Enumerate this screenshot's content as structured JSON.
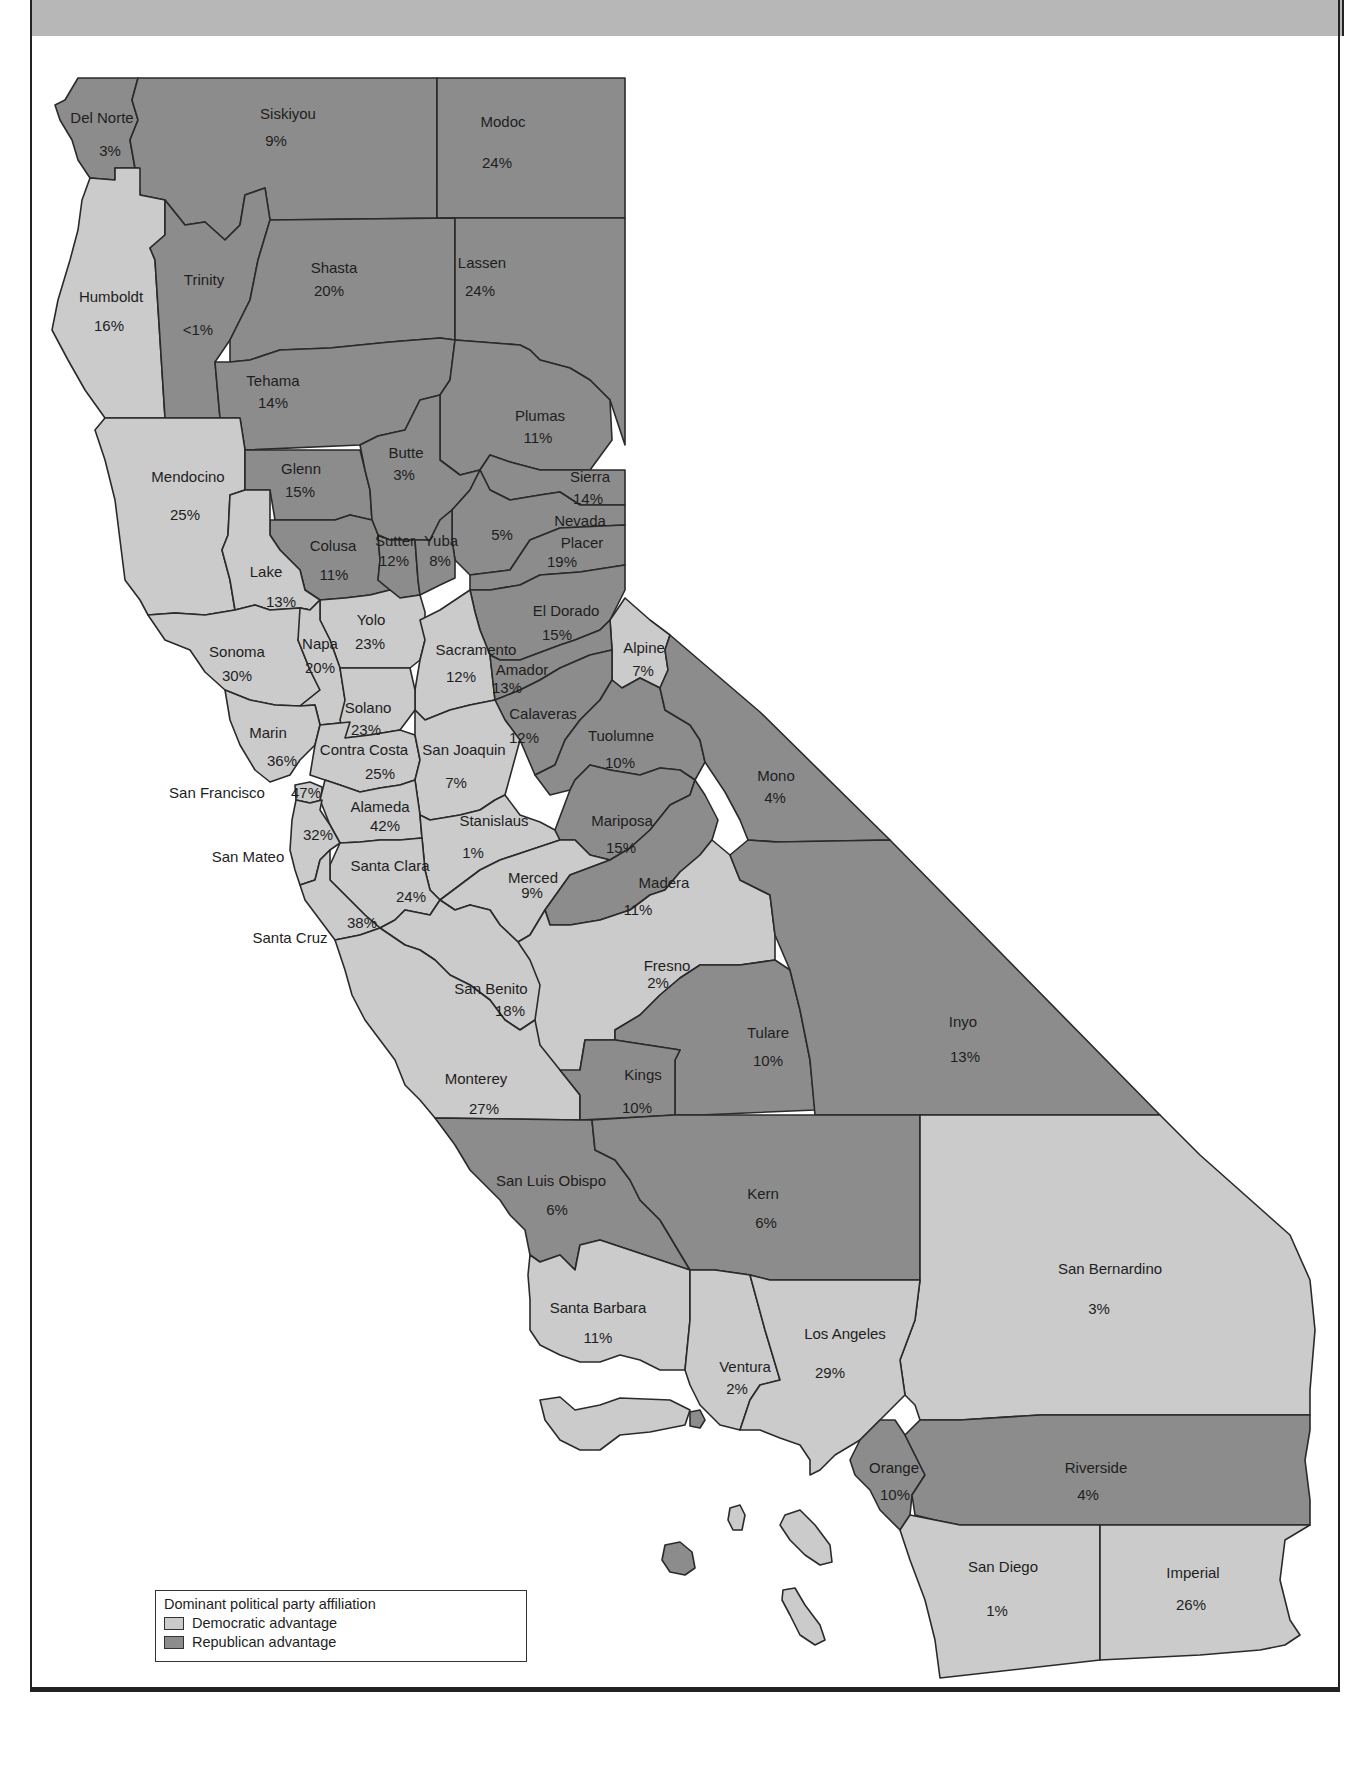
{
  "legend": {
    "title": "Dominant political party affiliation",
    "items": [
      {
        "label": "Democratic advantage",
        "color": "#cbcbcb"
      },
      {
        "label": "Republican advantage",
        "color": "#8c8c8c"
      }
    ]
  },
  "colors": {
    "democratic": "#cbcbcb",
    "republican": "#8c8c8c",
    "header_band": "#b7b7b7"
  },
  "counties": [
    {
      "name": "Del Norte",
      "value": "3%",
      "party": "Republican"
    },
    {
      "name": "Siskiyou",
      "value": "9%",
      "party": "Republican"
    },
    {
      "name": "Modoc",
      "value": "24%",
      "party": "Republican"
    },
    {
      "name": "Humboldt",
      "value": "16%",
      "party": "Democratic"
    },
    {
      "name": "Trinity",
      "value": "<1%",
      "party": "Republican"
    },
    {
      "name": "Shasta",
      "value": "20%",
      "party": "Republican"
    },
    {
      "name": "Lassen",
      "value": "24%",
      "party": "Republican"
    },
    {
      "name": "Tehama",
      "value": "14%",
      "party": "Republican"
    },
    {
      "name": "Plumas",
      "value": "11%",
      "party": "Republican"
    },
    {
      "name": "Mendocino",
      "value": "25%",
      "party": "Democratic"
    },
    {
      "name": "Glenn",
      "value": "15%",
      "party": "Republican"
    },
    {
      "name": "Butte",
      "value": "3%",
      "party": "Republican"
    },
    {
      "name": "Sierra",
      "value": "14%",
      "party": "Republican"
    },
    {
      "name": "Nevada",
      "value": "5%",
      "party": "Republican"
    },
    {
      "name": "Placer",
      "value": "19%",
      "party": "Republican"
    },
    {
      "name": "Colusa",
      "value": "11%",
      "party": "Republican"
    },
    {
      "name": "Sutter",
      "value": "12%",
      "party": "Republican"
    },
    {
      "name": "Yuba",
      "value": "8%",
      "party": "Republican"
    },
    {
      "name": "Lake",
      "value": "13%",
      "party": "Democratic"
    },
    {
      "name": "El Dorado",
      "value": "15%",
      "party": "Republican"
    },
    {
      "name": "Yolo",
      "value": "23%",
      "party": "Democratic"
    },
    {
      "name": "Sonoma",
      "value": "30%",
      "party": "Democratic"
    },
    {
      "name": "Napa",
      "value": "20%",
      "party": "Democratic"
    },
    {
      "name": "Sacramento",
      "value": "12%",
      "party": "Democratic"
    },
    {
      "name": "Alpine",
      "value": "7%",
      "party": "Democratic"
    },
    {
      "name": "Amador",
      "value": "13%",
      "party": "Republican"
    },
    {
      "name": "Solano",
      "value": "23%",
      "party": "Democratic"
    },
    {
      "name": "Calaveras",
      "value": "12%",
      "party": "Republican"
    },
    {
      "name": "Marin",
      "value": "36%",
      "party": "Democratic"
    },
    {
      "name": "Contra Costa",
      "value": "25%",
      "party": "Democratic"
    },
    {
      "name": "San Joaquin",
      "value": "7%",
      "party": "Democratic"
    },
    {
      "name": "Tuolumne",
      "value": "10%",
      "party": "Republican"
    },
    {
      "name": "Mono",
      "value": "4%",
      "party": "Republican"
    },
    {
      "name": "San Francisco",
      "value": "47%",
      "party": "Democratic"
    },
    {
      "name": "Alameda",
      "value": "42%",
      "party": "Democratic"
    },
    {
      "name": "Stanislaus",
      "value": "1%",
      "party": "Democratic"
    },
    {
      "name": "Mariposa",
      "value": "15%",
      "party": "Republican"
    },
    {
      "name": "San Mateo",
      "value": "32%",
      "party": "Democratic"
    },
    {
      "name": "Santa Clara",
      "value": "24%",
      "party": "Democratic"
    },
    {
      "name": "Merced",
      "value": "9%",
      "party": "Democratic"
    },
    {
      "name": "Madera",
      "value": "11%",
      "party": "Republican"
    },
    {
      "name": "Santa Cruz",
      "value": "38%",
      "party": "Democratic"
    },
    {
      "name": "Fresno",
      "value": "2%",
      "party": "Democratic"
    },
    {
      "name": "San Benito",
      "value": "18%",
      "party": "Democratic"
    },
    {
      "name": "Tulare",
      "value": "10%",
      "party": "Republican"
    },
    {
      "name": "Inyo",
      "value": "13%",
      "party": "Republican"
    },
    {
      "name": "Monterey",
      "value": "27%",
      "party": "Democratic"
    },
    {
      "name": "Kings",
      "value": "10%",
      "party": "Republican"
    },
    {
      "name": "San Luis Obispo",
      "value": "6%",
      "party": "Republican"
    },
    {
      "name": "Kern",
      "value": "6%",
      "party": "Republican"
    },
    {
      "name": "San Bernardino",
      "value": "3%",
      "party": "Democratic"
    },
    {
      "name": "Santa Barbara",
      "value": "11%",
      "party": "Democratic"
    },
    {
      "name": "Los Angeles",
      "value": "29%",
      "party": "Democratic"
    },
    {
      "name": "Ventura",
      "value": "2%",
      "party": "Democratic"
    },
    {
      "name": "Orange",
      "value": "10%",
      "party": "Republican"
    },
    {
      "name": "Riverside",
      "value": "4%",
      "party": "Republican"
    },
    {
      "name": "San Diego",
      "value": "1%",
      "party": "Democratic"
    },
    {
      "name": "Imperial",
      "value": "26%",
      "party": "Democratic"
    }
  ]
}
